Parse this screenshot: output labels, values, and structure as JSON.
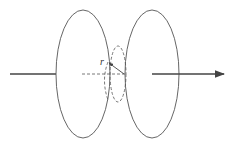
{
  "diagram": {
    "labels": {
      "radius": "r"
    },
    "colors": {
      "stroke": "#555555",
      "background": "#ffffff"
    }
  }
}
